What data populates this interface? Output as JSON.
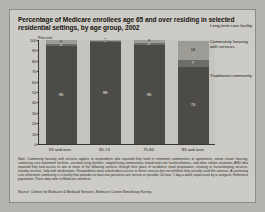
{
  "title": "Percentage of Medicare enrollees age 65 and over residing in selected residential settings, by age group, 2002",
  "axis": {
    "percent_label": "Percent",
    "yticks": [
      "100",
      "90",
      "80",
      "70",
      "60",
      "50",
      "40",
      "30",
      "20",
      "10",
      "0"
    ]
  },
  "legend": {
    "long_term_care": "Long-term care facility",
    "community_housing": "Community housing with services",
    "traditional": "Traditional community"
  },
  "notes": "Note: Community housing with services applies to respondents who reported they lived in retirement communities or apartments, senior citizen housing, continuing care retirement facilities, assisted living facilities, staged living communities, board and care facilities/homes, and other similar situations, AND who reported they had access to one or more of the following services through their place of residence: meal preparation, cleaning or housekeeping services, laundry services, help with medications. Respondents were asked about access to these services but not whether they actually used the services. A continuing care retirement community is a facility that provides at least one personal care service or provides 24-hour, 7-day-a-week supervision by a caregiver. Reference population: These data refer to Medicare enrollees.",
  "source": "Source: Centers for Medicare & Medicaid Services, Medicare Current Beneficiary Survey.",
  "chart_data": {
    "type": "bar",
    "title": "Percentage of Medicare enrollees age 65 and over residing in selected residential settings, by age group, 2002",
    "xlabel": "",
    "ylabel": "Percent",
    "ylim": [
      0,
      100
    ],
    "grid": false,
    "legend_position": "right",
    "stacked": true,
    "categories": [
      "65 and over",
      "65-74",
      "75-84",
      "85 and over"
    ],
    "series": [
      {
        "name": "Traditional community",
        "values": [
          95,
          98,
          95,
          74
        ],
        "color": "#4d4b47"
      },
      {
        "name": "Community housing with services",
        "values": [
          2,
          1,
          2,
          7
        ],
        "color": "#6e6c67"
      },
      {
        "name": "Long-term care facility",
        "values": [
          4,
          1,
          3,
          18
        ],
        "color": "#9d9b96"
      }
    ]
  }
}
